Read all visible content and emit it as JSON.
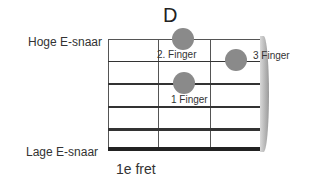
{
  "chord": {
    "name": "D"
  },
  "labels": {
    "high_string": "Hoge E-snaar",
    "low_string": "Lage E-snaar",
    "fret": "1e fret"
  },
  "colors": {
    "finger_dot": "#8a8a8a",
    "string": "#333333",
    "nut": "#aaaaaa"
  },
  "strings": [
    {
      "name": "high E",
      "y": 39,
      "thickness": 1
    },
    {
      "name": "B",
      "y": 61,
      "thickness": 1
    },
    {
      "name": "G",
      "y": 84,
      "thickness": 2
    },
    {
      "name": "D",
      "y": 107,
      "thickness": 2
    },
    {
      "name": "A",
      "y": 129,
      "thickness": 3
    },
    {
      "name": "low E",
      "y": 148,
      "thickness": 4
    }
  ],
  "frets_x": [
    108,
    158,
    210
  ],
  "fingers": [
    {
      "label": "2. Finger",
      "x": 183,
      "y": 39
    },
    {
      "label": "3 Finger",
      "x": 236,
      "y": 60
    },
    {
      "label": "1 Finger",
      "x": 184,
      "y": 83
    }
  ]
}
